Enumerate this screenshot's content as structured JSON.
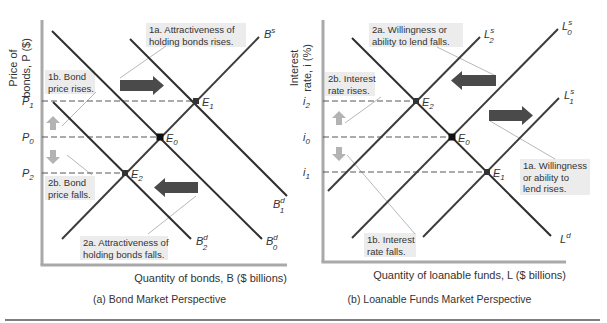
{
  "figure": {
    "bottom_rule_color": "#555555",
    "axis_color": "#a9a9a9",
    "curve_color": "#2e2e2e",
    "supply_color": "#3c3c3c",
    "dash_color": "#444444",
    "big_arrow_color": "#4a4a4a",
    "small_arrow_color": "#b3b3b3",
    "note_bg": "#ececec",
    "leader_color": "#9a9a9a"
  },
  "chart_data": [
    {
      "type": "line",
      "id": "bond-market",
      "title": "(a) Bond Market Perspective",
      "xlabel": "Quantity of bonds, B ($ billions)",
      "ylabel_line1": "Price of",
      "ylabel_line2": "bonds, P ($)",
      "y_ticks": [
        {
          "label": "P",
          "sub": "1",
          "y": 101
        },
        {
          "label": "P",
          "sub": "0",
          "y": 137
        },
        {
          "label": "P",
          "sub": "2",
          "y": 173
        }
      ],
      "axes": {
        "x0": 42,
        "y0": 20,
        "y1": 265,
        "x1": 287
      },
      "curves": [
        {
          "name": "B^s",
          "label": "B",
          "sup": "s",
          "x1": 62,
          "y1": 239,
          "x2": 259,
          "y2": 37,
          "label_x": 264,
          "label_y": 38,
          "kind": "supply"
        },
        {
          "name": "B^d_0",
          "label": "B",
          "sup": "d",
          "sub": "0",
          "x1": 52,
          "y1": 31,
          "x2": 262,
          "y2": 239,
          "label_x": 266,
          "label_y": 245,
          "kind": "demand"
        },
        {
          "name": "B^d_1",
          "label": "B",
          "sup": "d",
          "sub": "1",
          "x1": 130,
          "y1": 39,
          "x2": 287,
          "y2": 196,
          "label_x": 273,
          "label_y": 208,
          "kind": "demand"
        },
        {
          "name": "B^d_2",
          "label": "B",
          "sup": "d",
          "sub": "2",
          "x1": 53,
          "y1": 102,
          "x2": 191,
          "y2": 239,
          "label_x": 196,
          "label_y": 245,
          "kind": "demand"
        }
      ],
      "equilibria": [
        {
          "label": "E",
          "sub": "0",
          "x": 160,
          "y": 137,
          "tick": "P0",
          "marker": "filled"
        },
        {
          "label": "E",
          "sub": "1",
          "x": 196,
          "y": 101,
          "tick": "P1",
          "marker": "cross"
        },
        {
          "label": "E",
          "sub": "2",
          "x": 125,
          "y": 173,
          "tick": "P2",
          "marker": "cross"
        }
      ],
      "annotations": [
        {
          "id": "1a",
          "lines": [
            "1a. Attractiveness of",
            "holding bonds rises."
          ],
          "x": 146,
          "y": 23,
          "w": 100,
          "h": 24
        },
        {
          "id": "1b",
          "lines": [
            "1b. Bond",
            "price rises."
          ],
          "x": 45,
          "y": 70,
          "w": 50,
          "h": 24
        },
        {
          "id": "2a",
          "lines": [
            "2a. Attractiveness of",
            "holding bonds falls."
          ],
          "x": 80,
          "y": 236,
          "w": 88,
          "h": 24
        },
        {
          "id": "2b",
          "lines": [
            "2b. Bond",
            "price falls."
          ],
          "x": 45,
          "y": 176,
          "w": 50,
          "h": 24
        }
      ],
      "big_arrows": [
        {
          "dir": "right",
          "x": 120,
          "y": 80,
          "w": 44,
          "h": 11
        },
        {
          "dir": "left",
          "x": 154,
          "y": 182,
          "w": 44,
          "h": 11
        }
      ],
      "small_arrows": [
        {
          "dir": "up",
          "x": 53,
          "y": 118
        },
        {
          "dir": "down",
          "x": 53,
          "y": 150
        }
      ]
    },
    {
      "type": "line",
      "id": "loanable-funds-market",
      "title": "(b) Loanable Funds Market Perspective",
      "xlabel": "Quantity of loanable funds, L ($ billions)",
      "ylabel_line1": "Interest",
      "ylabel_line2": "rate, i (%)",
      "y_ticks": [
        {
          "label": "i",
          "sub": "2",
          "y": 101
        },
        {
          "label": "i",
          "sub": "0",
          "y": 137
        },
        {
          "label": "i",
          "sub": "1",
          "y": 172
        }
      ],
      "axes": {
        "x0": 323,
        "y0": 20,
        "y1": 262,
        "x1": 566
      },
      "curves": [
        {
          "name": "L^d",
          "label": "L",
          "sup": "d",
          "x1": 352,
          "y1": 38,
          "x2": 551,
          "y2": 236,
          "label_x": 560,
          "label_y": 243,
          "kind": "demand"
        },
        {
          "name": "L^s_0",
          "label": "L",
          "sup": "s",
          "sub": "0",
          "x1": 352,
          "y1": 238,
          "x2": 558,
          "y2": 29,
          "label_x": 562,
          "label_y": 30,
          "kind": "supply"
        },
        {
          "name": "L^s_1",
          "label": "L",
          "sup": "s",
          "sub": "1",
          "x1": 423,
          "y1": 237,
          "x2": 559,
          "y2": 98,
          "label_x": 564,
          "label_y": 99,
          "kind": "supply"
        },
        {
          "name": "L^s_2",
          "label": "L",
          "sup": "s",
          "sub": "2",
          "x1": 328,
          "y1": 191,
          "x2": 480,
          "y2": 37,
          "label_x": 484,
          "label_y": 38,
          "kind": "supply"
        }
      ],
      "equilibria": [
        {
          "label": "E",
          "sub": "0",
          "x": 452,
          "y": 137,
          "tick": "i0",
          "marker": "filled"
        },
        {
          "label": "E",
          "sub": "1",
          "x": 487,
          "y": 172,
          "tick": "i1",
          "marker": "cross"
        },
        {
          "label": "E",
          "sub": "2",
          "x": 416,
          "y": 101,
          "tick": "i2",
          "marker": "cross"
        }
      ],
      "annotations": [
        {
          "id": "2a",
          "lines": [
            "2a. Willingness or",
            "ability to lend falls."
          ],
          "x": 369,
          "y": 23,
          "w": 94,
          "h": 24
        },
        {
          "id": "2b",
          "lines": [
            "2b. Interest",
            "rate rises."
          ],
          "x": 325,
          "y": 72,
          "w": 50,
          "h": 24
        },
        {
          "id": "1a",
          "lines": [
            "1a. Willingness",
            "or ability to",
            "lend rises."
          ],
          "x": 520,
          "y": 159,
          "w": 70,
          "h": 36
        },
        {
          "id": "1b",
          "lines": [
            "1b. Interest",
            "rate falls."
          ],
          "x": 364,
          "y": 233,
          "w": 52,
          "h": 24
        }
      ],
      "big_arrows": [
        {
          "dir": "left",
          "x": 451,
          "y": 75,
          "w": 45,
          "h": 11
        },
        {
          "dir": "right",
          "x": 489,
          "y": 110,
          "w": 44,
          "h": 11
        }
      ],
      "small_arrows": [
        {
          "dir": "up",
          "x": 339,
          "y": 113
        },
        {
          "dir": "down",
          "x": 339,
          "y": 147
        }
      ]
    }
  ],
  "leaders": [
    {
      "x1": 166,
      "y1": 46,
      "x2": 120,
      "y2": 78
    },
    {
      "x1": 96,
      "y1": 92,
      "x2": 62,
      "y2": 126
    },
    {
      "x1": 67,
      "y1": 155,
      "x2": 92,
      "y2": 175
    },
    {
      "x1": 148,
      "y1": 234,
      "x2": 196,
      "y2": 196
    },
    {
      "x1": 381,
      "y1": 97,
      "x2": 345,
      "y2": 123
    },
    {
      "x1": 496,
      "y1": 76,
      "x2": 437,
      "y2": 47
    },
    {
      "x1": 490,
      "y1": 121,
      "x2": 555,
      "y2": 159
    },
    {
      "x1": 347,
      "y1": 155,
      "x2": 415,
      "y2": 234
    }
  ]
}
